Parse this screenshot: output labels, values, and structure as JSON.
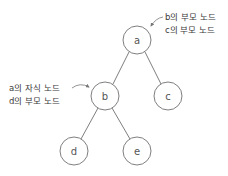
{
  "diagram": {
    "type": "tree",
    "nodes": [
      {
        "id": "a",
        "label": "a"
      },
      {
        "id": "b",
        "label": "b"
      },
      {
        "id": "c",
        "label": "c"
      },
      {
        "id": "d",
        "label": "d"
      },
      {
        "id": "e",
        "label": "e"
      }
    ],
    "edges": [
      {
        "from": "a",
        "to": "b"
      },
      {
        "from": "a",
        "to": "c"
      },
      {
        "from": "b",
        "to": "d"
      },
      {
        "from": "b",
        "to": "e"
      }
    ],
    "annotations": {
      "node_a": {
        "target": "a",
        "lines": [
          "b의 부모 노드",
          "c의 부모 노드"
        ]
      },
      "node_b": {
        "target": "b",
        "lines": [
          "a의 자식 노드",
          "d의 부모 노드"
        ]
      }
    },
    "colors": {
      "line": "#707070",
      "text": "#3a3a3a",
      "background": "#ffffff"
    }
  }
}
